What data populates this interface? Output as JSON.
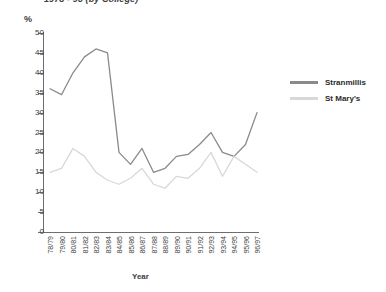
{
  "title": "1978 - 96 (by College)",
  "axes": {
    "y_unit": "%",
    "y_ticks": [
      0,
      5,
      10,
      15,
      20,
      25,
      30,
      35,
      40,
      45,
      50
    ],
    "x_title": "Year"
  },
  "legend": {
    "position": "right",
    "items": [
      {
        "label": "Stranmillis",
        "color": "#8a8a8a"
      },
      {
        "label": "St Mary's",
        "color": "#d8d8d8"
      }
    ]
  },
  "chart_data": {
    "type": "line",
    "title": "1978 - 96 (by College)",
    "xlabel": "Year",
    "ylabel": "%",
    "ylim": [
      0,
      50
    ],
    "ytick_step": 5,
    "grid": false,
    "legend_position": "right",
    "categories": [
      "78/79",
      "79/80",
      "80/81",
      "81/82",
      "82/83",
      "83/84",
      "84/85",
      "85/86",
      "86/87",
      "87/88",
      "88/89",
      "89/90",
      "90/91",
      "91/92",
      "92/93",
      "93/94",
      "94/95",
      "95/96",
      "96/97"
    ],
    "series": [
      {
        "name": "Stranmillis",
        "color": "#8a8a8a",
        "values": [
          36,
          34.5,
          40,
          44,
          46,
          45,
          20,
          17,
          21,
          15,
          16,
          19,
          19.5,
          22,
          25,
          20,
          19,
          22,
          30
        ]
      },
      {
        "name": "St Mary's",
        "color": "#d8d8d8",
        "values": [
          15,
          16,
          21,
          19,
          15,
          13,
          12,
          13.5,
          16,
          12,
          11,
          14,
          13.5,
          16,
          20,
          14,
          19,
          17,
          15
        ]
      }
    ]
  }
}
